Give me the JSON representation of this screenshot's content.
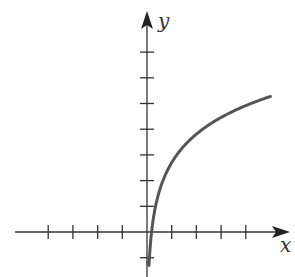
{
  "chart_data": {
    "type": "line",
    "title": "",
    "xlabel": "x",
    "ylabel": "y",
    "grid": false,
    "legend": null,
    "x_ticks": [
      -4,
      -3,
      -2,
      -1,
      1,
      2,
      3,
      4
    ],
    "y_ticks": [
      -1,
      1,
      2,
      3,
      4,
      5,
      6,
      7
    ],
    "xlim": [
      -5.3,
      5.7
    ],
    "ylim": [
      -1.8,
      8.6
    ],
    "tick_labels_shown": false,
    "series": [
      {
        "name": "curve",
        "description": "increasing logarithmic-shaped curve, vertical asymptote near the y-axis",
        "color": "#555555",
        "x": [
          0.02,
          0.05,
          0.1,
          0.18,
          0.3,
          0.5,
          0.75,
          1,
          1.5,
          2,
          2.5,
          3,
          3.5,
          4,
          4.5,
          5
        ],
        "y": [
          -1.2,
          -0.5,
          -0.6,
          0.0,
          0.8,
          1.6,
          2.2,
          2.7,
          3.35,
          3.8,
          4.15,
          4.45,
          4.7,
          4.9,
          5.1,
          5.3
        ]
      }
    ]
  },
  "axes": {
    "x_label": "x",
    "y_label": "y",
    "axis_color": "#333333",
    "curve_color": "#555555"
  }
}
